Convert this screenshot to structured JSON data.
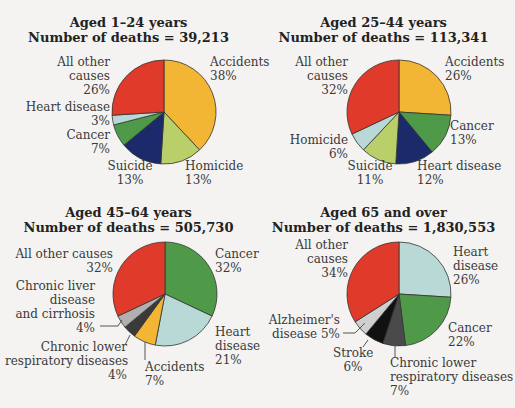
{
  "chart_data": [
    {
      "type": "pie",
      "title": "Aged 1–24 years",
      "subtitle": "Number of deaths = 39,213",
      "categories": [
        "Accidents",
        "Homicide",
        "Suicide",
        "Cancer",
        "Heart disease",
        "All other causes"
      ],
      "values": [
        38,
        13,
        13,
        7,
        3,
        26
      ],
      "colors": [
        "#f2b534",
        "#b9cf6a",
        "#1b2a6b",
        "#4f9a48",
        "#b8d9d6",
        "#e03a2a"
      ]
    },
    {
      "type": "pie",
      "title": "Aged 25–44 years",
      "subtitle": "Number of deaths = 113,341",
      "categories": [
        "Accidents",
        "Cancer",
        "Heart disease",
        "Suicide",
        "Homicide",
        "All other causes"
      ],
      "values": [
        26,
        13,
        12,
        11,
        6,
        32
      ],
      "colors": [
        "#f2b534",
        "#4f9a48",
        "#1b2a6b",
        "#b9cf6a",
        "#b8d9d6",
        "#e03a2a"
      ]
    },
    {
      "type": "pie",
      "title": "Aged 45–64 years",
      "subtitle": "Number of deaths = 505,730",
      "categories": [
        "Cancer",
        "Heart disease",
        "Accidents",
        "Chronic lower respiratory diseases",
        "Chronic liver disease and cirrhosis",
        "All other causes"
      ],
      "values": [
        32,
        21,
        7,
        4,
        4,
        32
      ],
      "colors": [
        "#4f9a48",
        "#b8d9d6",
        "#f2b534",
        "#3a3a3a",
        "#b0b0b0",
        "#e03a2a"
      ]
    },
    {
      "type": "pie",
      "title": "Aged 65 and over",
      "subtitle": "Number of deaths = 1,830,553",
      "categories": [
        "Heart disease",
        "Cancer",
        "Chronic lower respiratory diseases",
        "Stroke",
        "Alzheimer's disease",
        "All other causes"
      ],
      "values": [
        26,
        22,
        7,
        6,
        5,
        34
      ],
      "colors": [
        "#b8d9d6",
        "#4f9a48",
        "#4a4a4a",
        "#111111",
        "#cfcfcf",
        "#e03a2a"
      ]
    }
  ],
  "labels": {
    "p1": {
      "title": "Aged 1–24 years",
      "sub": "Number of deaths = 39,213",
      "acc": "Accidents",
      "acc_v": "38%",
      "hom": "Homicide",
      "hom_v": "13%",
      "sui": "Suicide",
      "sui_v": "13%",
      "can": "Cancer",
      "can_v": "7%",
      "hd": "Heart disease",
      "hd_v": "3%",
      "oth1": "All other",
      "oth2": "causes",
      "oth_v": "26%"
    },
    "p2": {
      "title": "Aged 25–44 years",
      "sub": "Number of deaths = 113,341",
      "acc": "Accidents",
      "acc_v": "26%",
      "can": "Cancer",
      "can_v": "13%",
      "hd": "Heart disease",
      "hd_v": "12%",
      "sui": "Suicide",
      "sui_v": "11%",
      "hom": "Homicide",
      "hom_v": "6%",
      "oth1": "All other",
      "oth2": "causes",
      "oth_v": "32%"
    },
    "p3": {
      "title": "Aged 45–64 years",
      "sub": "Number of deaths = 505,730",
      "can": "Cancer",
      "can_v": "32%",
      "hd1": "Heart",
      "hd2": "disease",
      "hd_v": "21%",
      "acc": "Accidents",
      "acc_v": "7%",
      "clr1": "Chronic lower",
      "clr2": "respiratory diseases",
      "clr_v": "4%",
      "liv1": "Chronic liver",
      "liv2": "disease",
      "liv3": "and cirrhosis",
      "liv_v": "4%",
      "oth": "All other causes",
      "oth_v": "32%"
    },
    "p4": {
      "title": "Aged 65 and over",
      "sub": "Number of deaths = 1,830,553",
      "hd1": "Heart",
      "hd2": "disease",
      "hd_v": "26%",
      "can": "Cancer",
      "can_v": "22%",
      "clr1": "Chronic lower",
      "clr2": "respiratory diseases",
      "clr_v": "7%",
      "str": "Stroke",
      "str_v": "6%",
      "alz1": "Alzheimer's",
      "alz2": "disease 5%",
      "oth1": "All other",
      "oth2": "causes",
      "oth_v": "34%"
    }
  }
}
